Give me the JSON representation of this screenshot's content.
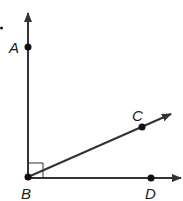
{
  "diagram": {
    "type": "geometry-rays",
    "colors": {
      "stroke": "#333333",
      "point": "#111111",
      "background": "#ffffff"
    },
    "points": {
      "A": {
        "label": "A",
        "x": 28,
        "y": 47
      },
      "B": {
        "label": "B",
        "x": 28,
        "y": 177
      },
      "C": {
        "label": "C",
        "x": 142,
        "y": 127
      },
      "D": {
        "label": "D",
        "x": 151,
        "y": 178
      }
    },
    "rays": [
      {
        "name": "ray-BA",
        "from": "B",
        "through": "A"
      },
      {
        "name": "ray-BC",
        "from": "B",
        "through": "C"
      },
      {
        "name": "ray-BD",
        "from": "B",
        "through": "D"
      }
    ],
    "marks": [
      {
        "type": "right-angle",
        "at": "B",
        "between": [
          "A",
          "D"
        ]
      }
    ]
  }
}
